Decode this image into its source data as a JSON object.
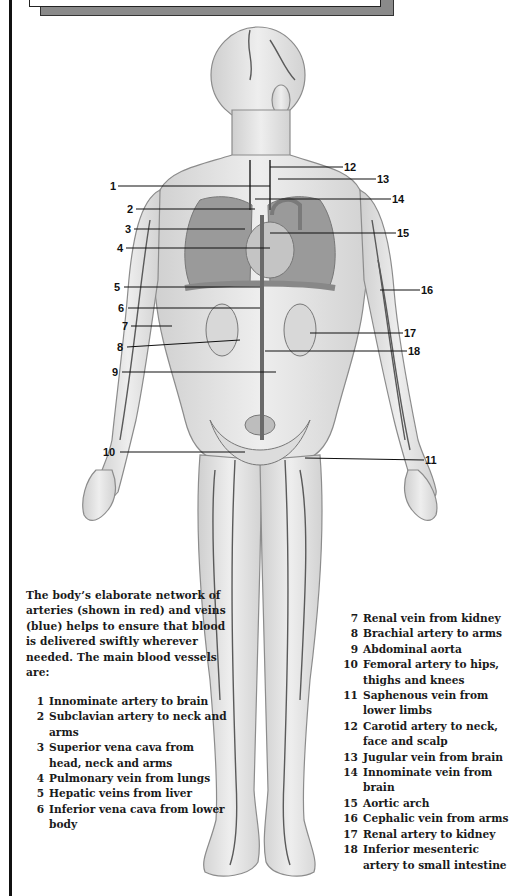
{
  "title_box": {
    "text": ""
  },
  "figure": {
    "style": "grayscale anatomical illustration"
  },
  "callouts": [
    {
      "num": "1",
      "x": 110,
      "y": 180,
      "lx1": 118,
      "lx2": 270,
      "ly": 186
    },
    {
      "num": "2",
      "x": 127,
      "y": 203,
      "lx1": 136,
      "lx2": 255,
      "ly": 209
    },
    {
      "num": "3",
      "x": 125,
      "y": 223,
      "lx1": 134,
      "lx2": 245,
      "ly": 229
    },
    {
      "num": "4",
      "x": 117,
      "y": 242,
      "lx1": 126,
      "lx2": 270,
      "ly": 248
    },
    {
      "num": "5",
      "x": 114,
      "y": 281,
      "lx1": 124,
      "lx2": 260,
      "ly": 287
    },
    {
      "num": "6",
      "x": 118,
      "y": 302,
      "lx1": 128,
      "lx2": 260,
      "ly": 308
    },
    {
      "num": "7",
      "x": 122,
      "y": 320,
      "lx1": 131,
      "lx2": 172,
      "ly": 326
    },
    {
      "num": "8",
      "x": 117,
      "y": 341,
      "lx1": 127,
      "lx2": 240,
      "ly": 347
    },
    {
      "num": "9",
      "x": 112,
      "y": 366,
      "lx1": 122,
      "lx2": 276,
      "ly": 372
    },
    {
      "num": "10",
      "x": 103,
      "y": 446,
      "lx1": 120,
      "lx2": 245,
      "ly": 452
    },
    {
      "num": "11",
      "x": 425,
      "y": 454,
      "lx1": 305,
      "lx2": 424,
      "ly": 460
    },
    {
      "num": "12",
      "x": 344,
      "y": 161,
      "lx1": 270,
      "lx2": 343,
      "ly": 167
    },
    {
      "num": "13",
      "x": 377,
      "y": 173,
      "lx1": 278,
      "lx2": 376,
      "ly": 179
    },
    {
      "num": "14",
      "x": 392,
      "y": 193,
      "lx1": 255,
      "lx2": 391,
      "ly": 199
    },
    {
      "num": "15",
      "x": 397,
      "y": 227,
      "lx1": 270,
      "lx2": 396,
      "ly": 233
    },
    {
      "num": "16",
      "x": 421,
      "y": 284,
      "lx1": 380,
      "lx2": 420,
      "ly": 290
    },
    {
      "num": "17",
      "x": 404,
      "y": 327,
      "lx1": 310,
      "lx2": 403,
      "ly": 333
    },
    {
      "num": "18",
      "x": 408,
      "y": 345,
      "lx1": 265,
      "lx2": 407,
      "ly": 351
    }
  ],
  "intro_text": "The body’s elaborate network of arteries (shown in red) and veins (blue) helps to ensure that blood is delivered swiftly wherever needed. The main blood vessels are:",
  "legend_left": [
    {
      "num": "1",
      "text": "Innominate artery to brain"
    },
    {
      "num": "2",
      "text": "Subclavian artery to neck and arms"
    },
    {
      "num": "3",
      "text": "Superior vena cava from head, neck and arms"
    },
    {
      "num": "4",
      "text": "Pulmonary vein from lungs"
    },
    {
      "num": "5",
      "text": "Hepatic veins from liver"
    },
    {
      "num": "6",
      "text": "Inferior vena cava from lower body"
    }
  ],
  "legend_right": [
    {
      "num": "7",
      "text": "Renal vein from kidney"
    },
    {
      "num": "8",
      "text": "Brachial artery to arms"
    },
    {
      "num": "9",
      "text": "Abdominal aorta"
    },
    {
      "num": "10",
      "text": "Femoral artery to hips, thighs and knees"
    },
    {
      "num": "11",
      "text": "Saphenous vein from lower limbs"
    },
    {
      "num": "12",
      "text": "Carotid artery to neck, face and scalp"
    },
    {
      "num": "13",
      "text": "Jugular vein from brain"
    },
    {
      "num": "14",
      "text": "Innominate vein from brain"
    },
    {
      "num": "15",
      "text": "Aortic arch"
    },
    {
      "num": "16",
      "text": "Cephalic vein from arms"
    },
    {
      "num": "17",
      "text": "Renal artery to kidney"
    },
    {
      "num": "18",
      "text": "Inferior mesenteric artery to small intestine"
    }
  ],
  "colors": {
    "ink": "#111111",
    "figure_fill": "#e6e6e6",
    "figure_stroke": "#8c8c8c",
    "vessel": "#5a5a5a",
    "shadow": "#8a8a8a"
  }
}
